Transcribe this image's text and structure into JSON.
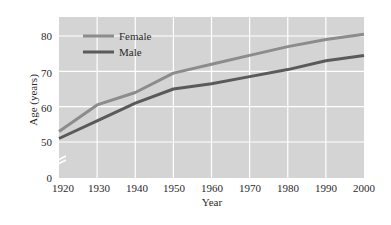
{
  "chart_data": {
    "type": "line",
    "title": "",
    "xlabel": "Year",
    "ylabel": "Age (years)",
    "x": [
      1920,
      1930,
      1940,
      1950,
      1960,
      1970,
      1980,
      1990,
      2000
    ],
    "series": [
      {
        "name": "Female",
        "color": "#8c8c8c",
        "values": [
          53,
          60.5,
          64,
          69.5,
          72,
          74.5,
          77,
          79,
          80.5
        ]
      },
      {
        "name": "Male",
        "color": "#5a5a5a",
        "values": [
          51,
          56,
          61,
          65,
          66.5,
          68.5,
          70.5,
          73,
          74.5
        ]
      }
    ],
    "x_ticks": [
      "1920",
      "1930",
      "1940",
      "1950",
      "1960",
      "1970",
      "1980",
      "1990",
      "2000"
    ],
    "y_ticks": [
      "0",
      "50",
      "60",
      "70",
      "80"
    ],
    "ylim": [
      0,
      85
    ],
    "xlim": [
      1920,
      2000
    ],
    "y_axis_break": "between 0 and 50",
    "grid": true,
    "legend_position": "upper left",
    "plot_background": "#d4d4d4",
    "grid_color": "#ffffff"
  },
  "legend": {
    "female": "Female",
    "male": "Male"
  },
  "axes": {
    "xlabel": "Year",
    "ylabel": "Age (years)"
  },
  "ticks": {
    "x": [
      "1920",
      "1930",
      "1940",
      "1950",
      "1960",
      "1970",
      "1980",
      "1990",
      "2000"
    ],
    "y": {
      "0": "0",
      "50": "50",
      "60": "60",
      "70": "70",
      "80": "80"
    }
  }
}
